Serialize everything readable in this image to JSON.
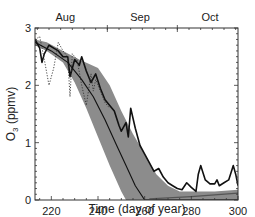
{
  "chart_data": {
    "type": "line",
    "title": "",
    "xlabel": "Time (day of year)",
    "ylabel": "O3 (ppmv)",
    "ylabel_main": "O",
    "ylabel_sub": "3",
    "ylabel_rest": " (ppmv)",
    "xlim": [
      213,
      300
    ],
    "ylim": [
      0,
      3
    ],
    "grid": false,
    "legend": null,
    "x_ticks": [
      220,
      240,
      260,
      280,
      300
    ],
    "y_ticks": [
      0,
      1,
      2,
      3
    ],
    "top_axis_labels": [
      {
        "label": "Aug",
        "day": 226
      },
      {
        "label": "Sep",
        "day": 258
      },
      {
        "label": "Oct",
        "day": 288
      }
    ],
    "top_axis_major_days": [
      244,
      274
    ],
    "series": [
      {
        "name": "model-range-band",
        "style": "gray-fill",
        "color": "#8c8c8c",
        "upper": {
          "x": [
            213,
            218,
            225,
            232,
            240,
            245,
            250,
            255,
            260,
            265,
            270,
            275,
            280,
            290,
            300
          ],
          "y": [
            2.8,
            2.75,
            2.6,
            2.45,
            2.3,
            2.0,
            1.55,
            1.15,
            0.8,
            0.45,
            0.25,
            0.15,
            0.15,
            0.15,
            0.18
          ]
        },
        "lower": {
          "x": [
            213,
            218,
            225,
            230,
            235,
            240,
            245,
            250,
            252,
            300
          ],
          "y": [
            2.7,
            2.6,
            2.4,
            2.05,
            1.6,
            1.1,
            0.6,
            0.15,
            0.0,
            0.0
          ]
        }
      },
      {
        "name": "observed",
        "style": "thick-solid",
        "color": "#111111",
        "x": [
          213,
          215,
          216,
          217,
          219,
          221,
          223,
          225,
          227,
          228,
          230,
          232,
          233,
          235,
          237,
          239,
          241,
          243,
          245,
          247,
          249,
          250,
          252,
          253,
          254,
          256,
          258,
          260,
          262,
          264,
          266,
          268,
          270,
          272,
          274,
          276,
          278,
          280,
          282,
          283,
          284,
          286,
          288,
          290,
          291,
          292,
          294,
          296,
          298,
          299,
          300
        ],
        "y": [
          2.8,
          2.65,
          2.4,
          2.55,
          2.7,
          2.65,
          2.6,
          2.5,
          2.5,
          2.15,
          2.45,
          2.35,
          2.5,
          2.25,
          2.05,
          2.2,
          1.95,
          1.75,
          1.65,
          1.55,
          1.3,
          1.2,
          1.35,
          1.1,
          1.6,
          1.25,
          0.95,
          0.8,
          0.65,
          0.5,
          0.55,
          0.4,
          0.3,
          0.25,
          0.2,
          0.18,
          0.3,
          0.22,
          0.15,
          0.45,
          0.6,
          0.35,
          0.28,
          0.28,
          0.35,
          0.25,
          0.3,
          0.35,
          0.6,
          0.45,
          0.25
        ]
      },
      {
        "name": "observed-detail",
        "style": "dotted",
        "color": "#333333",
        "x": [
          213,
          215,
          217,
          219,
          221,
          223,
          225,
          227,
          228,
          229,
          231,
          233,
          235,
          237,
          238,
          239,
          241,
          243,
          245
        ],
        "y": [
          2.8,
          2.85,
          2.45,
          2.0,
          2.3,
          2.75,
          2.6,
          2.5,
          1.8,
          2.55,
          2.45,
          2.0,
          1.65,
          2.2,
          1.9,
          2.1,
          1.9,
          1.7,
          1.6
        ]
      },
      {
        "name": "model-mean",
        "style": "thin-solid",
        "color": "#111111",
        "x": [
          213,
          220,
          227,
          233,
          238,
          243,
          248,
          252,
          256,
          260,
          262,
          300
        ],
        "y": [
          2.75,
          2.6,
          2.4,
          2.1,
          1.8,
          1.4,
          0.95,
          0.6,
          0.25,
          0.0,
          0.0,
          0.0
        ]
      },
      {
        "name": "baseline",
        "style": "thin-gray",
        "color": "#555555",
        "x": [
          262,
          280,
          300
        ],
        "y": [
          0.02,
          0.06,
          0.12
        ]
      }
    ]
  }
}
